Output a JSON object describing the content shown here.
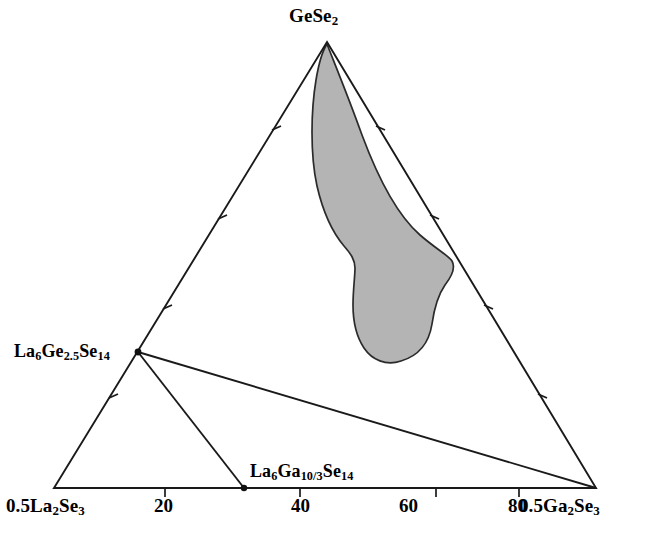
{
  "figure": {
    "type": "ternary-phase-diagram",
    "background_color": "#ffffff",
    "line_color": "#1a1a1a",
    "shaded_region_fill": "#b4b4b4",
    "shaded_region_stroke": "#2b2b2b"
  },
  "vertices": {
    "apex": {
      "label_html": "GeSe<sub>2</sub>",
      "text": "GeSe2",
      "x": 327,
      "y": 42
    },
    "bottom_left": {
      "label_html": "0.5La<sub>2</sub>Se<sub>3</sub>",
      "text": "0.5La2Se3",
      "x": 54,
      "y": 488
    },
    "bottom_right": {
      "label_html": "0.5Ga<sub>2</sub>Se<sub>3</sub>",
      "text": "0.5Ga2Se3",
      "x": 596,
      "y": 488
    }
  },
  "compounds": [
    {
      "name": "la6ge25se14",
      "label_html": "La<sub>6</sub>Ge<sub>2.5</sub>Se<sub>14</sub>",
      "text": "La6Ge2.5Se14",
      "x": 138,
      "y": 352,
      "on_edge": "left",
      "marker": true
    },
    {
      "name": "la6ga103se14",
      "label_html": "La<sub>6</sub>Ga<sub>10/3</sub>Se<sub>14</sub>",
      "text": "La6Ga10/3Se14",
      "x": 244,
      "y": 488,
      "on_edge": "bottom",
      "marker": true
    }
  ],
  "axis": {
    "bottom_tick_labels": [
      "20",
      "40",
      "60",
      "80"
    ],
    "bottom_tick_values": [
      20,
      40,
      60,
      80
    ],
    "bottom_tick_x": [
      165,
      300,
      436,
      519
    ],
    "tick_count_per_edge": 4
  },
  "tie_lines": [
    {
      "name": "la6ge25se14-to-ga2se3",
      "from": [
        138,
        352
      ],
      "to": [
        596,
        488
      ]
    },
    {
      "name": "la6ge25se14-to-la6ga103se14",
      "from": [
        138,
        352
      ],
      "to": [
        244,
        488
      ]
    }
  ],
  "chart_data": {
    "type": "ternary",
    "title": "",
    "xlabel": "",
    "ylabel": "",
    "components": [
      "0.5La2Se3",
      "GeSe2",
      "0.5Ga2Se3"
    ],
    "axis_ticks": [
      20,
      40,
      60,
      80
    ],
    "grid": false,
    "legend": "none",
    "annotations": [
      "GeSe2",
      "0.5La2Se3",
      "0.5Ga2Se3",
      "La6Ge2.5Se14",
      "La6Ga10/3Se14"
    ],
    "series": [
      {
        "name": "glass-forming-region",
        "type": "shaded-region",
        "fill": "#b4b4b4",
        "description": "Shaded glass-forming domain extending from the GeSe2 apex downward toward the middle-right of the triangle"
      },
      {
        "name": "tie-lines",
        "type": "lines",
        "points": [
          [
            138,
            352
          ],
          [
            596,
            488
          ],
          [
            244,
            488
          ]
        ]
      }
    ],
    "points": [
      {
        "label": "GeSe2",
        "role": "vertex"
      },
      {
        "label": "0.5La2Se3",
        "role": "vertex"
      },
      {
        "label": "0.5Ga2Se3",
        "role": "vertex"
      },
      {
        "label": "La6Ge2.5Se14",
        "role": "compound-on-left-edge"
      },
      {
        "label": "La6Ga10/3Se14",
        "role": "compound-on-bottom-edge"
      }
    ]
  }
}
